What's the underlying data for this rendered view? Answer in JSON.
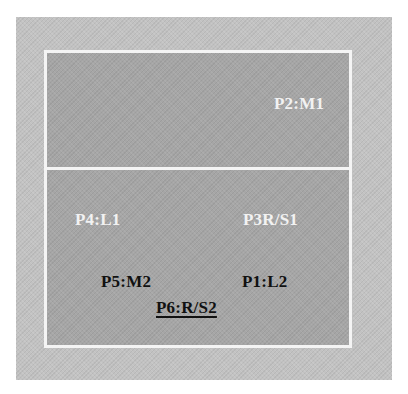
{
  "diagram": {
    "type": "court-positions",
    "colors": {
      "outer_frame": "#c2c2c2",
      "court_fill": "#a6a6a6",
      "court_lines": "#f4f4f4",
      "light_label": "#f2f2f2",
      "dark_label": "#111111"
    },
    "zones": [
      {
        "name": "upper-zone",
        "labels": [
          "P2:M1"
        ]
      },
      {
        "name": "lower-zone",
        "labels": [
          "P4:L1",
          "P3R/S1",
          "P5:M2",
          "P1:L2",
          "P6:R/S2"
        ]
      }
    ],
    "labels": {
      "p2": {
        "text": "P2:M1",
        "style": "light"
      },
      "p4": {
        "text": "P4:L1",
        "style": "light"
      },
      "p3": {
        "text": "P3R/S1",
        "style": "light"
      },
      "p5": {
        "text": "P5:M2",
        "style": "dark"
      },
      "p1": {
        "text": "P1:L2",
        "style": "dark"
      },
      "p6": {
        "text": "P6:R/S2",
        "style": "dark-underlined"
      }
    }
  }
}
